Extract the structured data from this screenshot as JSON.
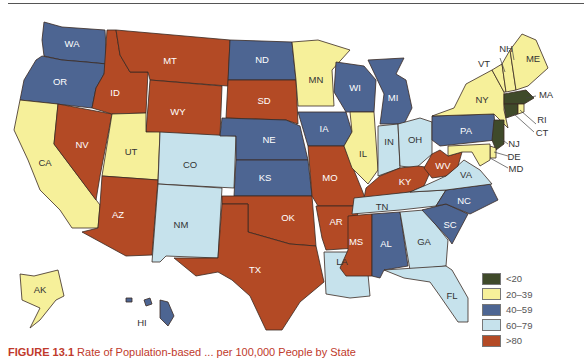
{
  "figure": {
    "caption_label": "FIGURE 13.1",
    "caption_text": "Rate of Population-based ... per 100,000 People by State"
  },
  "colors": {
    "lt20": "#3f4a2a",
    "c20_39": "#f6f09a",
    "c40_59": "#4d6592",
    "c60_79": "#c6e2ec",
    "gt80": "#b34a25"
  },
  "legend": {
    "items": [
      {
        "label": "<20",
        "color": "#3f4a2a"
      },
      {
        "label": "20–39",
        "color": "#f6f09a"
      },
      {
        "label": "40–59",
        "color": "#4d6592"
      },
      {
        "label": "60–79",
        "color": "#c6e2ec"
      },
      {
        "label": ">80",
        "color": "#b34a25"
      }
    ]
  },
  "states": {
    "WA": {
      "label": "WA",
      "category": "40–59"
    },
    "OR": {
      "label": "OR",
      "category": "40–59"
    },
    "CA": {
      "label": "CA",
      "category": "20–39"
    },
    "NV": {
      "label": "NV",
      "category": ">80"
    },
    "ID": {
      "label": "ID",
      "category": ">80"
    },
    "MT": {
      "label": "MT",
      "category": ">80"
    },
    "WY": {
      "label": "WY",
      "category": ">80"
    },
    "UT": {
      "label": "UT",
      "category": "20–39"
    },
    "AZ": {
      "label": "AZ",
      "category": ">80"
    },
    "CO": {
      "label": "CO",
      "category": "60–79"
    },
    "NM": {
      "label": "NM",
      "category": "60–79"
    },
    "ND": {
      "label": "ND",
      "category": "40–59"
    },
    "SD": {
      "label": "SD",
      "category": ">80"
    },
    "NE": {
      "label": "NE",
      "category": "40–59"
    },
    "KS": {
      "label": "KS",
      "category": "40–59"
    },
    "OK": {
      "label": "OK",
      "category": ">80"
    },
    "TX": {
      "label": "TX",
      "category": ">80"
    },
    "MN": {
      "label": "MN",
      "category": "20–39"
    },
    "IA": {
      "label": "IA",
      "category": "40–59"
    },
    "MO": {
      "label": "MO",
      "category": ">80"
    },
    "AR": {
      "label": "AR",
      "category": ">80"
    },
    "LA": {
      "label": "LA",
      "category": "60–79"
    },
    "WI": {
      "label": "WI",
      "category": "40–59"
    },
    "IL": {
      "label": "IL",
      "category": "20–39"
    },
    "MI": {
      "label": "MI",
      "category": "40–59"
    },
    "IN": {
      "label": "IN",
      "category": "60–79"
    },
    "OH": {
      "label": "OH",
      "category": "60–79"
    },
    "KY": {
      "label": "KY",
      "category": ">80"
    },
    "TN": {
      "label": "TN",
      "category": "60–79"
    },
    "MS": {
      "label": "MS",
      "category": ">80"
    },
    "AL": {
      "label": "AL",
      "category": "40–59"
    },
    "GA": {
      "label": "GA",
      "category": "60–79"
    },
    "FL": {
      "label": "FL",
      "category": "60–79"
    },
    "SC": {
      "label": "SC",
      "category": "40–59"
    },
    "NC": {
      "label": "NC",
      "category": "40–59"
    },
    "VA": {
      "label": "VA",
      "category": "60–79"
    },
    "WV": {
      "label": "WV",
      "category": ">80"
    },
    "PA": {
      "label": "PA",
      "category": "40–59"
    },
    "NY": {
      "label": "NY",
      "category": "20–39"
    },
    "VT": {
      "label": "VT",
      "category": "20–39"
    },
    "NH": {
      "label": "NH",
      "category": "20–39"
    },
    "ME": {
      "label": "ME",
      "category": "20–39"
    },
    "MA": {
      "label": "MA",
      "category": "<20"
    },
    "RI": {
      "label": "RI",
      "category": "20–39"
    },
    "CT": {
      "label": "CT",
      "category": "<20"
    },
    "NJ": {
      "label": "NJ",
      "category": "<20"
    },
    "DE": {
      "label": "DE",
      "category": "20–39"
    },
    "MD": {
      "label": "MD",
      "category": "20–39"
    },
    "AK": {
      "label": "AK",
      "category": "20–39"
    },
    "HI": {
      "label": "HI",
      "category": "40–59"
    }
  }
}
